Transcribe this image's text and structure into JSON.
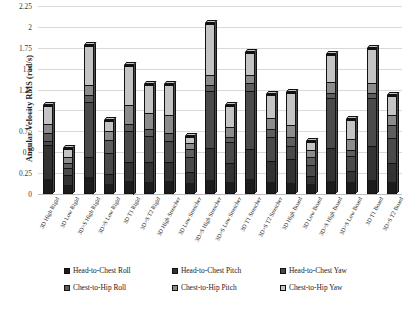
{
  "chart_data": {
    "type": "bar",
    "subtype": "stacked-column-3d",
    "title": "",
    "xlabel": "",
    "ylabel": "Angular Velocity RMS (rad/s)",
    "ylim": [
      0,
      2.25
    ],
    "yticks": [
      0,
      0.25,
      0.5,
      0.75,
      1,
      1.25,
      1.5,
      1.75,
      2,
      2.25
    ],
    "ytick_labels": [
      "0",
      "0.25",
      "0.5",
      "0.75",
      "1",
      "1.25",
      "1.5",
      "1.75",
      "2",
      "2.25"
    ],
    "grid": true,
    "legend_position": "bottom",
    "categories": [
      "3D High Rigid",
      "3D Low Rigid",
      "3D>S High Rigid",
      "3D>S Low Rigid",
      "3D T1 Rigid",
      "3D>S T2 Rigid",
      "3D High Stretcher",
      "3D Low Stretcher",
      "3D>S High Stretcher",
      "3D>S Low Stretcher",
      "3D T1 Stretcher",
      "3D>S T2 Stretcher",
      "3D High Board",
      "3D Low Board",
      "3D>S High Board",
      "3D>S Low Board",
      "3D T1 Board",
      "3D>S T2 Board"
    ],
    "series": [
      {
        "name": "Head-to-Chest Roll",
        "color": "#1c1c1c",
        "values": [
          0.17,
          0.1,
          0.19,
          0.11,
          0.15,
          0.14,
          0.15,
          0.13,
          0.16,
          0.13,
          0.17,
          0.13,
          0.12,
          0.11,
          0.14,
          0.13,
          0.16,
          0.13
        ]
      },
      {
        "name": "Head-to-Chest Pitch",
        "color": "#333333",
        "values": [
          0.42,
          0.12,
          0.25,
          0.13,
          0.23,
          0.24,
          0.23,
          0.13,
          0.38,
          0.24,
          0.37,
          0.26,
          0.3,
          0.1,
          0.41,
          0.14,
          0.41,
          0.24
        ]
      },
      {
        "name": "Head-to-Chest Yaw",
        "color": "#4a4a4a",
        "values": [
          0.05,
          0.09,
          0.67,
          0.25,
          0.37,
          0.31,
          0.25,
          0.19,
          0.7,
          0.25,
          0.7,
          0.3,
          0.16,
          0.14,
          0.6,
          0.18,
          0.58,
          0.3
        ]
      },
      {
        "name": "Chest-to-Hip Roll",
        "color": "#5e5e5e",
        "values": [
          0.1,
          0.06,
          0.08,
          0.16,
          0.09,
          0.09,
          0.1,
          0.1,
          0.07,
          0.07,
          0.1,
          0.09,
          0.1,
          0.1,
          0.07,
          0.08,
          0.06,
          0.16
        ]
      },
      {
        "name": "Chest-to-Hip Pitch",
        "color": "#8c8c8c",
        "values": [
          0.1,
          0.08,
          0.12,
          0.11,
          0.23,
          0.2,
          0.22,
          0.07,
          0.12,
          0.12,
          0.09,
          0.14,
          0.15,
          0.08,
          0.13,
          0.13,
          0.13,
          0.12
        ]
      },
      {
        "name": "Chest-to-Hip Yaw",
        "color": "#c4c4c4",
        "values": [
          0.23,
          0.1,
          0.47,
          0.13,
          0.48,
          0.34,
          0.37,
          0.07,
          0.62,
          0.26,
          0.27,
          0.28,
          0.39,
          0.1,
          0.33,
          0.24,
          0.41,
          0.24
        ]
      }
    ],
    "totals": [
      1.07,
      0.55,
      1.78,
      0.89,
      1.55,
      1.32,
      1.32,
      0.69,
      2.05,
      1.07,
      1.7,
      1.2,
      1.22,
      0.63,
      1.68,
      0.9,
      1.75,
      1.19
    ]
  },
  "legend": {
    "items": [
      {
        "label": "Head-to-Chest Roll",
        "color": "#1c1c1c"
      },
      {
        "label": "Head-to-Chest Pitch",
        "color": "#333333"
      },
      {
        "label": "Head-to-Chest Yaw",
        "color": "#4a4a4a"
      },
      {
        "label": "Chest-to-Hip Roll",
        "color": "#5e5e5e"
      },
      {
        "label": "Chest-to-Hip Pitch",
        "color": "#8c8c8c"
      },
      {
        "label": "Chest-to-Hip Yaw",
        "color": "#c4c4c4"
      }
    ]
  }
}
